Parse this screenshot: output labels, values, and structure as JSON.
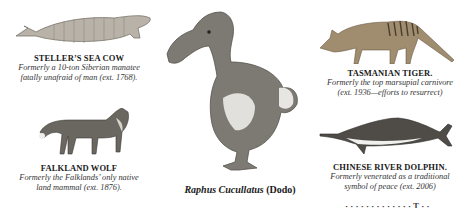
{
  "panels": {
    "sea_cow": {
      "title": "STELLER’S SEA COW",
      "caption_line1": "Formerly a 10-ton Siberian manatee",
      "caption_line2": "fatally unafraid of man (ext. 1768).",
      "icon": "sea-cow-illustration"
    },
    "falkland_wolf": {
      "title": "FALKLAND WOLF",
      "caption_line1": "Formerly the Falklands’ only native",
      "caption_line2": "land mammal (ext. 1876).",
      "icon": "wolf-illustration"
    },
    "dodo": {
      "caption_italic": "Raphus Cucullatus",
      "caption_bold": " (Dodo)",
      "icon": "dodo-illustration"
    },
    "tasmanian_tiger": {
      "title": "TASMANIAN TIGER.",
      "caption_line1": "Formerly the top marsupial carnivore",
      "caption_line2": "(ext. 1936—efforts to resurrect)",
      "icon": "thylacine-illustration"
    },
    "river_dolphin": {
      "title": "CHINESE RIVER DOLPHIN.",
      "caption_line1": "Formerly venerated as a traditional",
      "caption_line2": "symbol of peace (ext. 2006)",
      "icon": "dolphin-illustration"
    }
  },
  "clipped_text": "· ·  · · ·  · · · ·  · · · ·  T · ·"
}
